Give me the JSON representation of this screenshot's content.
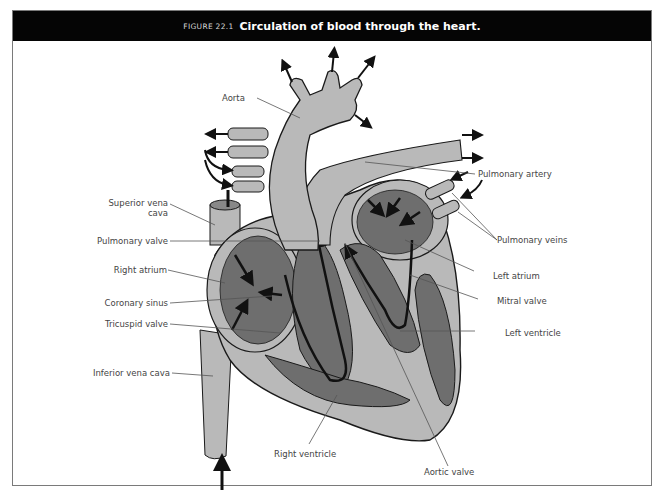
{
  "figure": {
    "number": "FIGURE 22.1",
    "title": "Circulation of blood through the heart."
  },
  "labels": {
    "left": [
      {
        "id": "superior-vena-cava",
        "text": "Superior vena",
        "text2": "cava"
      },
      {
        "id": "pulmonary-valve",
        "text": "Pulmonary valve"
      },
      {
        "id": "right-atrium",
        "text": "Right atrium"
      },
      {
        "id": "coronary-sinus",
        "text": "Coronary sinus"
      },
      {
        "id": "tricuspid-valve",
        "text": "Tricuspid valve"
      },
      {
        "id": "inferior-vena-cava",
        "text": "Inferior vena cava"
      }
    ],
    "top": [
      {
        "id": "aorta",
        "text": "Aorta"
      }
    ],
    "right": [
      {
        "id": "pulmonary-artery",
        "text": "Pulmonary artery"
      },
      {
        "id": "pulmonary-veins",
        "text": "Pulmonary veins"
      },
      {
        "id": "left-atrium",
        "text": "Left atrium"
      },
      {
        "id": "mitral-valve",
        "text": "Mitral valve"
      },
      {
        "id": "left-ventricle",
        "text": "Left ventricle"
      }
    ],
    "bottom": [
      {
        "id": "right-ventricle",
        "text": "Right ventricle"
      },
      {
        "id": "aortic-valve",
        "text": "Aortic valve"
      }
    ]
  },
  "colors": {
    "title_bar": "#050505",
    "tissue_light": "#b9b9b9",
    "tissue_dark": "#6e6e6e",
    "outline": "#1a1a1a",
    "leader_line": "#555555"
  }
}
